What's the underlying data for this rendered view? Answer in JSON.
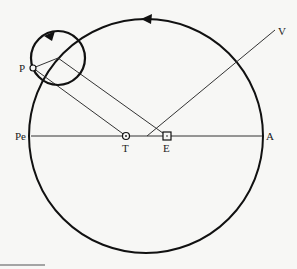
{
  "diagram": {
    "labels": {
      "P": "P",
      "Pe": "Pe",
      "T": "T",
      "E": "E",
      "A": "A",
      "V": "V"
    },
    "colors": {
      "ink": "#111111",
      "thin_line": "#333333",
      "background": "#f7f7f5",
      "footer_rule": "#888888"
    },
    "deferent": {
      "cx": 146,
      "cy": 136,
      "r": 117,
      "direction": "counterclockwise"
    },
    "epicycle": {
      "cx": 58,
      "cy": 58,
      "r": 27,
      "direction": "counterclockwise"
    },
    "points": {
      "P": [
        33,
        68
      ],
      "T": [
        126,
        136
      ],
      "E": [
        167,
        136
      ],
      "V_origin": [
        147,
        136
      ],
      "V_end": [
        275,
        30
      ],
      "Pe": [
        31,
        136
      ],
      "A": [
        262,
        136
      ]
    }
  }
}
